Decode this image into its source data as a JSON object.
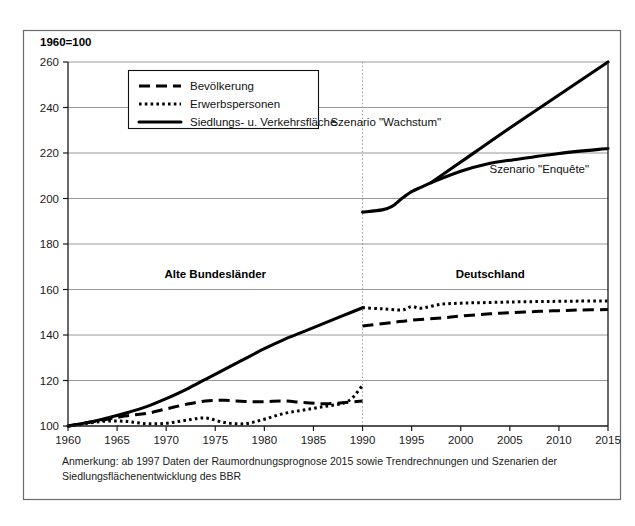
{
  "figure": {
    "axis_title": "1960=100",
    "note_lines": [
      "Anmerkung: ab 1997 Daten der Raumordnungsprognose 2015 sowie Trendrechnungen und Szenarien der",
      "Siedlungsflächenentwicklung des BBR"
    ],
    "region_labels": [
      {
        "text": "Alte Bundesländer",
        "x": 1975,
        "y": 165
      },
      {
        "text": "Deutschland",
        "x": 2003,
        "y": 165
      }
    ],
    "scenario_labels": [
      {
        "text": "Szenario \"Wachstum\"",
        "x": 1998,
        "y": 232,
        "anchor": "end"
      },
      {
        "text": "Szenario \"Enquête\"",
        "x": 2008,
        "y": 211,
        "anchor": "middle"
      }
    ],
    "divider_year": 1990
  },
  "legend": {
    "position": "top-left-inside",
    "entries": [
      {
        "label": "Bevölkerung",
        "style": "dashed"
      },
      {
        "label": "Erwerbspersonen",
        "style": "dotted"
      },
      {
        "label": "Siedlungs- u. Verkehrsfläche",
        "style": "solid"
      }
    ]
  },
  "chart_data": {
    "type": "line",
    "title": "1960=100",
    "xlabel": "",
    "ylabel": "1960=100",
    "xlim": [
      1960,
      2015
    ],
    "ylim": [
      100,
      260
    ],
    "yticks": [
      100,
      120,
      140,
      160,
      180,
      200,
      220,
      240,
      260
    ],
    "xticks": [
      1960,
      1965,
      1970,
      1975,
      1980,
      1985,
      1990,
      1995,
      2000,
      2005,
      2010,
      2015
    ],
    "grid": true,
    "legend_position": "upper left",
    "series": [
      {
        "name": "Siedlungs- u. Verkehrsfläche",
        "style": "solid",
        "segment": "Alte Bundesländer",
        "x": [
          1960,
          1962,
          1964,
          1966,
          1968,
          1970,
          1972,
          1974,
          1976,
          1978,
          1980,
          1982,
          1984,
          1986,
          1988,
          1990
        ],
        "values": [
          100.0,
          101.5,
          103.5,
          105.8,
          108.5,
          112.0,
          116.0,
          120.5,
          125.0,
          129.5,
          134.0,
          138.0,
          141.5,
          145.0,
          148.5,
          152.0
        ]
      },
      {
        "name": "Bevölkerung",
        "style": "dashed",
        "segment": "Alte Bundesländer",
        "x": [
          1960,
          1962,
          1964,
          1966,
          1968,
          1970,
          1972,
          1974,
          1976,
          1978,
          1980,
          1982,
          1984,
          1986,
          1988,
          1990
        ],
        "values": [
          100.0,
          101.5,
          103.0,
          104.5,
          105.5,
          107.5,
          109.5,
          111.0,
          111.3,
          110.8,
          110.7,
          111.0,
          110.3,
          109.8,
          110.2,
          111.0
        ]
      },
      {
        "name": "Erwerbspersonen",
        "style": "dotted",
        "segment": "Alte Bundesländer",
        "x": [
          1960,
          1962,
          1964,
          1966,
          1968,
          1970,
          1972,
          1974,
          1976,
          1978,
          1980,
          1982,
          1984,
          1986,
          1988,
          1989,
          1990
        ],
        "values": [
          100.0,
          101.2,
          102.2,
          102.0,
          101.0,
          101.2,
          102.5,
          103.5,
          101.5,
          101.0,
          103.0,
          105.5,
          107.0,
          108.5,
          110.0,
          112.5,
          118.0
        ]
      },
      {
        "name": "Siedlungs- u. Verkehrsfläche (Deutschland)",
        "style": "solid",
        "segment": "Deutschland",
        "x": [
          1990,
          1992,
          1993,
          1994,
          1995,
          1996,
          1997
        ],
        "values": [
          194.0,
          195.0,
          196.5,
          200.0,
          203.0,
          205.0,
          207.0
        ]
      },
      {
        "name": "Szenario \"Wachstum\"",
        "style": "solid",
        "segment": "Deutschland",
        "x": [
          1997,
          2000,
          2005,
          2010,
          2015
        ],
        "values": [
          207.0,
          216.0,
          231.0,
          245.5,
          260.0
        ]
      },
      {
        "name": "Szenario \"Enquête\"",
        "style": "solid",
        "segment": "Deutschland",
        "x": [
          1997,
          2000,
          2003,
          2005,
          2010,
          2015
        ],
        "values": [
          207.0,
          212.0,
          215.5,
          216.8,
          219.8,
          222.0
        ]
      },
      {
        "name": "Erwerbspersonen (Deutschland)",
        "style": "dotted",
        "segment": "Deutschland",
        "x": [
          1990,
          1992,
          1994,
          1995,
          1996,
          1998,
          2000,
          2002,
          2005,
          2008,
          2010,
          2012,
          2015
        ],
        "values": [
          152.0,
          151.5,
          151.0,
          152.5,
          151.8,
          153.5,
          154.0,
          154.2,
          154.5,
          154.7,
          154.8,
          154.9,
          155.0
        ]
      },
      {
        "name": "Bevölkerung (Deutschland)",
        "style": "dashed",
        "segment": "Deutschland",
        "x": [
          1990,
          1993,
          1995,
          1998,
          2000,
          2003,
          2005,
          2008,
          2010,
          2012,
          2015
        ],
        "values": [
          144.0,
          145.5,
          146.5,
          147.5,
          148.3,
          149.3,
          149.8,
          150.4,
          150.7,
          151.0,
          151.2
        ]
      }
    ]
  }
}
